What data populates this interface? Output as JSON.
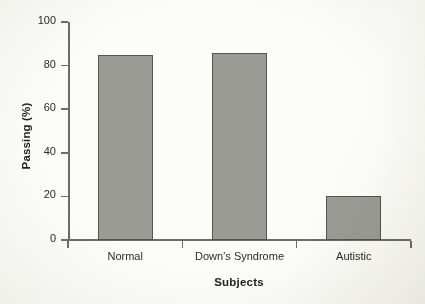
{
  "chart_data": {
    "type": "bar",
    "title": "",
    "xlabel": "Subjects",
    "ylabel": "Passing (%)",
    "categories": [
      "Normal",
      "Down’s Syndrome",
      "Autistic"
    ],
    "values": [
      85,
      86,
      20
    ],
    "ylim": [
      0,
      100
    ],
    "yticks": [
      0,
      20,
      40,
      60,
      80,
      100
    ],
    "ytick_labels": [
      "0",
      "20",
      "40",
      "60",
      "80",
      "100"
    ],
    "grid": false,
    "legend": null,
    "bar_color": "#9b9b96",
    "bar_edge_color": "#55554f",
    "axis_color": "#6d6d67",
    "background_color": "#fcfcf8",
    "text_color": "#24241f"
  },
  "figure": {
    "name": "passing-percentage-by-subject-group-bar-chart"
  }
}
